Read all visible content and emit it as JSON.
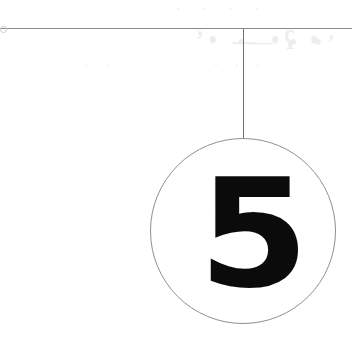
{
  "page": {
    "kind": "scanned-document-fragment",
    "width": 352,
    "height": 345,
    "background_color": "#ffffff"
  },
  "marker": {
    "number": "5",
    "number_color": "#0b0b0b",
    "circle_stroke_color": "#8f8f95",
    "circle_center_x": 243,
    "circle_center_y": 231,
    "circle_radius": 93
  },
  "rules": {
    "horizontal_label": "horizontal-rule",
    "horizontal_color": "#8a8a8e",
    "horizontal_y": 28,
    "vertical_label": "vertical-leader-line",
    "vertical_color": "#6f6f74",
    "vertical_x": 243,
    "vertical_top": 29,
    "vertical_bottom": 138
  },
  "ghosting": {
    "description": "faint show-through marks from reverse side of page",
    "color": "#ededf0",
    "marks": [
      "’• — •ʕ •",
      "•— • •’",
      "· · · ·",
      "· · ·",
      "· ·"
    ]
  }
}
